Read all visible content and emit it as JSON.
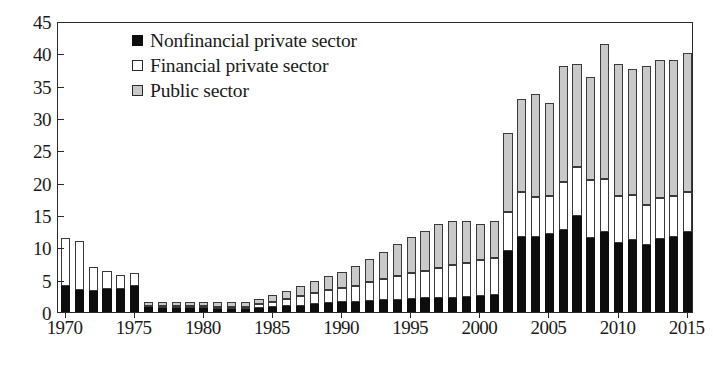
{
  "chart_data": {
    "type": "bar",
    "stacked": true,
    "title": "",
    "xlabel": "",
    "ylabel": "",
    "ylim": [
      0,
      45
    ],
    "ytick_values": [
      0,
      5,
      10,
      15,
      20,
      25,
      30,
      35,
      40,
      45
    ],
    "ytick_labels": [
      "0",
      "5",
      "10",
      "15",
      "20",
      "25",
      "30",
      "35",
      "40",
      "45"
    ],
    "xtick_labels": [
      "1970",
      "1975",
      "1980",
      "1985",
      "1990",
      "1995",
      "2000",
      "2005",
      "2010",
      "2015"
    ],
    "grid": false,
    "legend_position": "top-left",
    "categories": [
      "1970",
      "1971",
      "1972",
      "1973",
      "1974",
      "1975",
      "1976",
      "1977",
      "1978",
      "1979",
      "1980",
      "1981",
      "1982",
      "1983",
      "1984",
      "1985",
      "1986",
      "1987",
      "1988",
      "1989",
      "1990",
      "1991",
      "1992",
      "1993",
      "1994",
      "1995",
      "1996",
      "1997",
      "1998",
      "1999",
      "2000",
      "2001",
      "2002",
      "2003",
      "2004",
      "2005",
      "2006",
      "2007",
      "2008",
      "2009",
      "2010",
      "2011",
      "2012",
      "2013",
      "2014",
      "2015"
    ],
    "series": [
      {
        "name": "Nonfinancial private sector",
        "color": "#0d0d0d",
        "values": [
          4.0,
          3.4,
          3.3,
          3.6,
          3.5,
          4.0,
          0.7,
          0.6,
          0.6,
          0.6,
          0.6,
          0.5,
          0.5,
          0.5,
          0.6,
          0.7,
          0.9,
          1.0,
          1.2,
          1.4,
          1.5,
          1.6,
          1.7,
          1.8,
          1.9,
          2.0,
          2.1,
          2.2,
          2.2,
          2.3,
          2.4,
          2.6,
          9.4,
          11.6,
          11.6,
          12.0,
          12.7,
          14.9,
          11.5,
          12.4,
          10.7,
          11.2,
          10.4,
          11.3,
          11.6,
          12.4
        ]
      },
      {
        "name": "Financial private sector",
        "color": "#ffffff",
        "values": [
          7.5,
          7.6,
          3.7,
          2.7,
          2.2,
          2.0,
          0.3,
          0.3,
          0.3,
          0.3,
          0.3,
          0.3,
          0.3,
          0.3,
          0.6,
          0.9,
          1.1,
          1.5,
          1.8,
          2.0,
          2.2,
          2.5,
          2.9,
          3.3,
          3.6,
          4.0,
          4.3,
          4.6,
          5.0,
          5.3,
          5.6,
          5.8,
          6.1,
          7.0,
          6.2,
          6.0,
          7.4,
          7.6,
          8.9,
          8.1,
          7.3,
          6.9,
          6.2,
          6.3,
          6.4,
          6.2
        ]
      },
      {
        "name": "Public sector",
        "color": "#c9c9c9",
        "values": [
          0.0,
          0.0,
          0.0,
          0.0,
          0.0,
          0.0,
          0.6,
          0.6,
          0.6,
          0.6,
          0.6,
          0.7,
          0.7,
          0.7,
          0.8,
          1.0,
          1.3,
          1.5,
          1.8,
          2.1,
          2.5,
          3.0,
          3.6,
          4.2,
          5.0,
          5.6,
          6.2,
          6.8,
          6.9,
          6.5,
          5.6,
          5.7,
          12.2,
          14.3,
          15.9,
          14.3,
          17.9,
          15.9,
          15.9,
          21.0,
          20.3,
          19.5,
          21.4,
          21.4,
          21.0,
          21.4
        ]
      }
    ]
  },
  "legend": {
    "items": [
      {
        "label": "Nonfinancial private sector",
        "swatch": "nonfin"
      },
      {
        "label": "Financial private sector",
        "swatch": "fin"
      },
      {
        "label": "Public sector",
        "swatch": "pub"
      }
    ]
  }
}
